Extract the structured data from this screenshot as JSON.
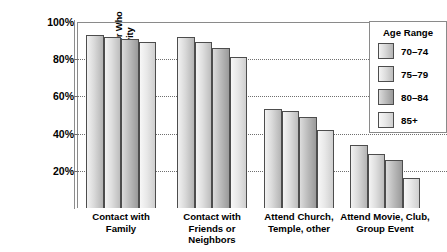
{
  "chart_data": {
    "type": "bar",
    "title": "",
    "xlabel": "",
    "ylabel": "Percentage of Persons Age 70 or Older Who Reported Engaging in Social Activity",
    "ylabel_lines": [
      "Percentage of Persons Age 70 or Older Who",
      "Reported Engaging in Social Activity"
    ],
    "ylim": [
      0,
      100
    ],
    "ytick_labels": [
      "100%",
      "80%",
      "60%",
      "40%",
      "20%"
    ],
    "ytick_values": [
      100,
      80,
      60,
      40,
      20
    ],
    "grid": "horizontal-dotted",
    "legend_position": "top-right",
    "categories": [
      "Contact with Family",
      "Contact with Friends or Neighbors",
      "Attend Church, Temple, other",
      "Attend Movie, Club, Group Event"
    ],
    "category_label_lines": [
      [
        "Contact with",
        "Family"
      ],
      [
        "Contact with",
        "Friends or",
        "Neighbors"
      ],
      [
        "Attend Church,",
        "Temple, other"
      ],
      [
        "Attend Movie, Club,",
        "Group Event"
      ]
    ],
    "series": [
      {
        "name": "70–74",
        "values": [
          93,
          92,
          53,
          34
        ]
      },
      {
        "name": "75–79",
        "values": [
          92,
          89,
          52,
          29
        ]
      },
      {
        "name": "80–84",
        "values": [
          91,
          86,
          49,
          26
        ]
      },
      {
        "name": "85+",
        "values": [
          89,
          81,
          42,
          16
        ]
      }
    ]
  },
  "legend": {
    "title": "Age Range",
    "entries": [
      "70–74",
      "75–79",
      "80–84",
      "85+"
    ]
  }
}
